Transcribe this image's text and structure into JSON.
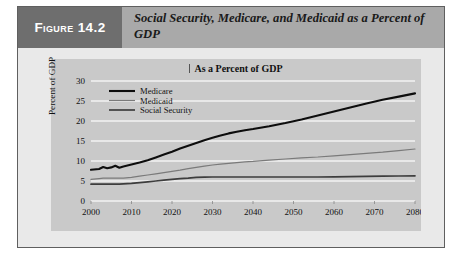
{
  "figure": {
    "tag_label": "Figure 14.2",
    "title": "Social Security, Medicare, and Medicaid as a Percent of GDP"
  },
  "colors": {
    "card_background": "#e9e9e9",
    "header_band": "#a9a9a9",
    "tag_block": "#6e6e6e",
    "plot_background": "#c9c9c9",
    "gridline": "#f2f2f2",
    "medicare_line": "#0d0d0d",
    "medicaid_line": "#7a7a7a",
    "social_security_line": "#3d3d3d",
    "border": "#5f5f5f"
  },
  "chart_data": {
    "type": "line",
    "title": "As a Percent of GDP",
    "xlabel": "",
    "ylabel": "Percent of GDP",
    "xlim": [
      2000,
      2080
    ],
    "ylim": [
      0,
      30
    ],
    "grid": true,
    "legend_position": "upper-left",
    "xticks": [
      2000,
      2010,
      2020,
      2030,
      2040,
      2050,
      2060,
      2070,
      2080
    ],
    "yticks": [
      0,
      5,
      10,
      15,
      20,
      25,
      30
    ],
    "x": [
      2000,
      2002,
      2003,
      2004,
      2005,
      2006,
      2007,
      2008,
      2010,
      2012,
      2014,
      2016,
      2018,
      2020,
      2022,
      2024,
      2026,
      2028,
      2030,
      2032,
      2034,
      2036,
      2038,
      2040,
      2044,
      2048,
      2052,
      2056,
      2060,
      2064,
      2068,
      2072,
      2076,
      2080
    ],
    "series": [
      {
        "name": "Medicare",
        "values": [
          7.8,
          8.0,
          8.5,
          8.2,
          8.4,
          8.8,
          8.3,
          8.6,
          9.1,
          9.6,
          10.2,
          10.9,
          11.6,
          12.3,
          13.1,
          13.8,
          14.5,
          15.2,
          15.8,
          16.4,
          16.9,
          17.3,
          17.7,
          18.0,
          18.7,
          19.5,
          20.4,
          21.4,
          22.4,
          23.4,
          24.4,
          25.3,
          26.1,
          26.9
        ]
      },
      {
        "name": "Medicaid",
        "values": [
          5.4,
          5.6,
          5.7,
          5.7,
          5.7,
          5.7,
          5.7,
          5.7,
          5.9,
          6.2,
          6.5,
          6.8,
          7.1,
          7.4,
          7.7,
          8.1,
          8.4,
          8.7,
          9.0,
          9.2,
          9.4,
          9.6,
          9.8,
          9.9,
          10.2,
          10.5,
          10.8,
          11.0,
          11.3,
          11.6,
          11.9,
          12.2,
          12.6,
          13.0
        ]
      },
      {
        "name": "Social Security",
        "values": [
          4.2,
          4.2,
          4.2,
          4.2,
          4.2,
          4.2,
          4.2,
          4.3,
          4.4,
          4.6,
          4.8,
          5.0,
          5.2,
          5.4,
          5.6,
          5.7,
          5.9,
          5.95,
          6.0,
          6.0,
          6.0,
          6.0,
          6.0,
          6.0,
          6.0,
          6.0,
          6.0,
          6.0,
          6.05,
          6.1,
          6.15,
          6.2,
          6.25,
          6.3
        ]
      }
    ]
  }
}
